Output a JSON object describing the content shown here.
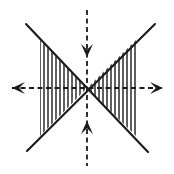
{
  "figure": {
    "width": 174,
    "height": 174,
    "background_color": "#ffffff",
    "stroke_color": "#1a1a1a",
    "hatch_color": "#2b2b2b"
  },
  "geometry": {
    "center": {
      "x": 87,
      "y": 88
    },
    "diagonals": [
      {
        "name": "diagonal-nw-se",
        "x1": 26,
        "y1": 24,
        "x2": 148,
        "y2": 152,
        "stroke_width": 2.1
      },
      {
        "name": "diagonal-ne-sw",
        "x1": 155,
        "y1": 24,
        "x2": 27,
        "y2": 151,
        "stroke_width": 2.1
      }
    ],
    "hatching": {
      "style": "vertical-lines",
      "spacing": 4,
      "stroke_width": 1.5,
      "regions": [
        {
          "name": "left-cone",
          "apex_x": 87,
          "apex_y": 88,
          "outer_x": 40,
          "top_y_at_outer": 40,
          "bottom_y_at_outer": 136
        },
        {
          "name": "right-cone",
          "apex_x": 87,
          "apex_y": 88,
          "outer_x": 136,
          "top_y_at_outer": 40,
          "bottom_y_at_outer": 136
        }
      ]
    },
    "axes": [
      {
        "name": "horizontal-axis",
        "orientation": "horizontal",
        "x1": 12,
        "y1": 88,
        "x2": 163,
        "y2": 88,
        "dash_pattern": "5,3.5",
        "stroke_width": 1.8,
        "arrow_start": "left",
        "arrow_end": "right",
        "arrow_direction": "outward"
      },
      {
        "name": "vertical-axis",
        "orientation": "vertical",
        "x1": 87,
        "y1": 10,
        "x2": 87,
        "y2": 166,
        "dash_pattern": "5,3.5",
        "stroke_width": 1.8,
        "arrow_start": "down",
        "arrow_end": "up",
        "arrow_direction": "inward"
      }
    ],
    "arrowheads": [
      {
        "name": "arrow-left",
        "tip_x": 12,
        "tip_y": 88,
        "points": "left",
        "length": 13,
        "half_width": 6
      },
      {
        "name": "arrow-right",
        "tip_x": 163,
        "tip_y": 88,
        "points": "right",
        "length": 13,
        "half_width": 6
      },
      {
        "name": "arrow-top",
        "tip_x": 87,
        "tip_y": 57,
        "points": "down",
        "length": 13,
        "half_width": 6
      },
      {
        "name": "arrow-bottom",
        "tip_x": 87,
        "tip_y": 121,
        "points": "up",
        "length": 13,
        "half_width": 6
      }
    ]
  },
  "labels": {
    "figure_caption": "",
    "axis_x_label": "",
    "axis_y_label": ""
  }
}
